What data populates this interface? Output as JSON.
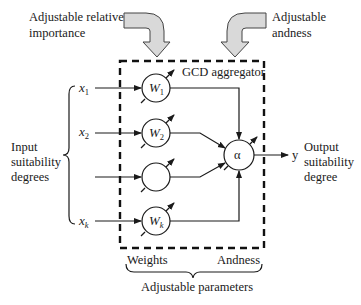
{
  "annotations": {
    "relative_importance": [
      "Adjustable relative",
      "importance"
    ],
    "andness": [
      "Adjustable",
      "andness"
    ],
    "aggregator_title": "GCD aggregator",
    "input_label": [
      "Input",
      "suitability",
      "degrees"
    ],
    "output_label": [
      "Output",
      "suitability",
      "degree"
    ],
    "weights_label": "Weights",
    "andness_label": "Andness",
    "parameters_label": "Adjustable parameters"
  },
  "inputs": [
    {
      "var": "x",
      "sub": "1"
    },
    {
      "var": "x",
      "sub": "2"
    },
    {
      "var": "",
      "sub": ""
    },
    {
      "var": "x",
      "sub": "k"
    }
  ],
  "weights": [
    {
      "var": "W",
      "sub": "1"
    },
    {
      "var": "W",
      "sub": "2"
    },
    {
      "var": "",
      "sub": ""
    },
    {
      "var": "W",
      "sub": "k"
    }
  ],
  "aggregator_symbol": "α",
  "output_var": "y"
}
